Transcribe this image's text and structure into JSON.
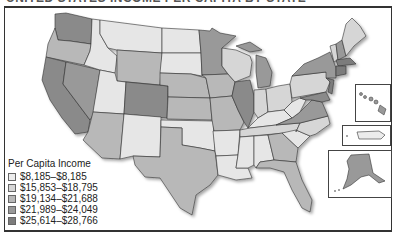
{
  "title": "UNITED STATES INCOME PER CAPITA BY STATE",
  "legend": {
    "title": "Per Capita Income",
    "items": [
      {
        "label": "$8,185–$8,185",
        "color": "#ececec"
      },
      {
        "label": "$15,853–$18,795",
        "color": "#d6d6d6"
      },
      {
        "label": "$19,134–$21,688",
        "color": "#b8b8b8"
      },
      {
        "label": "$21,989–$24,049",
        "color": "#999999"
      },
      {
        "label": "$25,614–$28,766",
        "color": "#7c7c7c"
      }
    ]
  },
  "insets": [
    "Hawaii",
    "Puerto Rico",
    "Alaska"
  ]
}
